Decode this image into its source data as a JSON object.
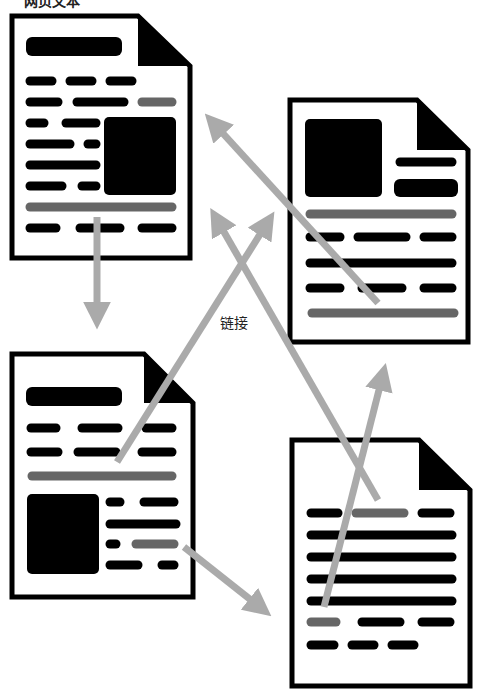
{
  "labels": {
    "top": "网页文本",
    "center": "链接"
  },
  "colors": {
    "ink": "#000000",
    "link_highlight": "#666666",
    "arrow": "#aaaaaa",
    "paper": "#ffffff"
  },
  "documents": [
    {
      "id": "doc-top-left",
      "x": 10,
      "y": 14,
      "w": 182,
      "h": 246
    },
    {
      "id": "doc-top-right",
      "x": 288,
      "y": 98,
      "w": 182,
      "h": 246
    },
    {
      "id": "doc-bottom-left",
      "x": 10,
      "y": 352,
      "w": 182,
      "h": 246
    },
    {
      "id": "doc-bottom-right",
      "x": 290,
      "y": 438,
      "w": 182,
      "h": 246
    }
  ],
  "arrows": [
    {
      "from": "doc-top-left",
      "to": "doc-bottom-left"
    },
    {
      "from": "doc-top-right",
      "to": "doc-top-left"
    },
    {
      "from": "doc-bottom-right",
      "to": "doc-top-left"
    },
    {
      "from": "doc-bottom-left",
      "to": "doc-top-right"
    },
    {
      "from": "doc-bottom-left",
      "to": "doc-bottom-right"
    },
    {
      "from": "doc-bottom-right",
      "to": "doc-top-right"
    }
  ]
}
